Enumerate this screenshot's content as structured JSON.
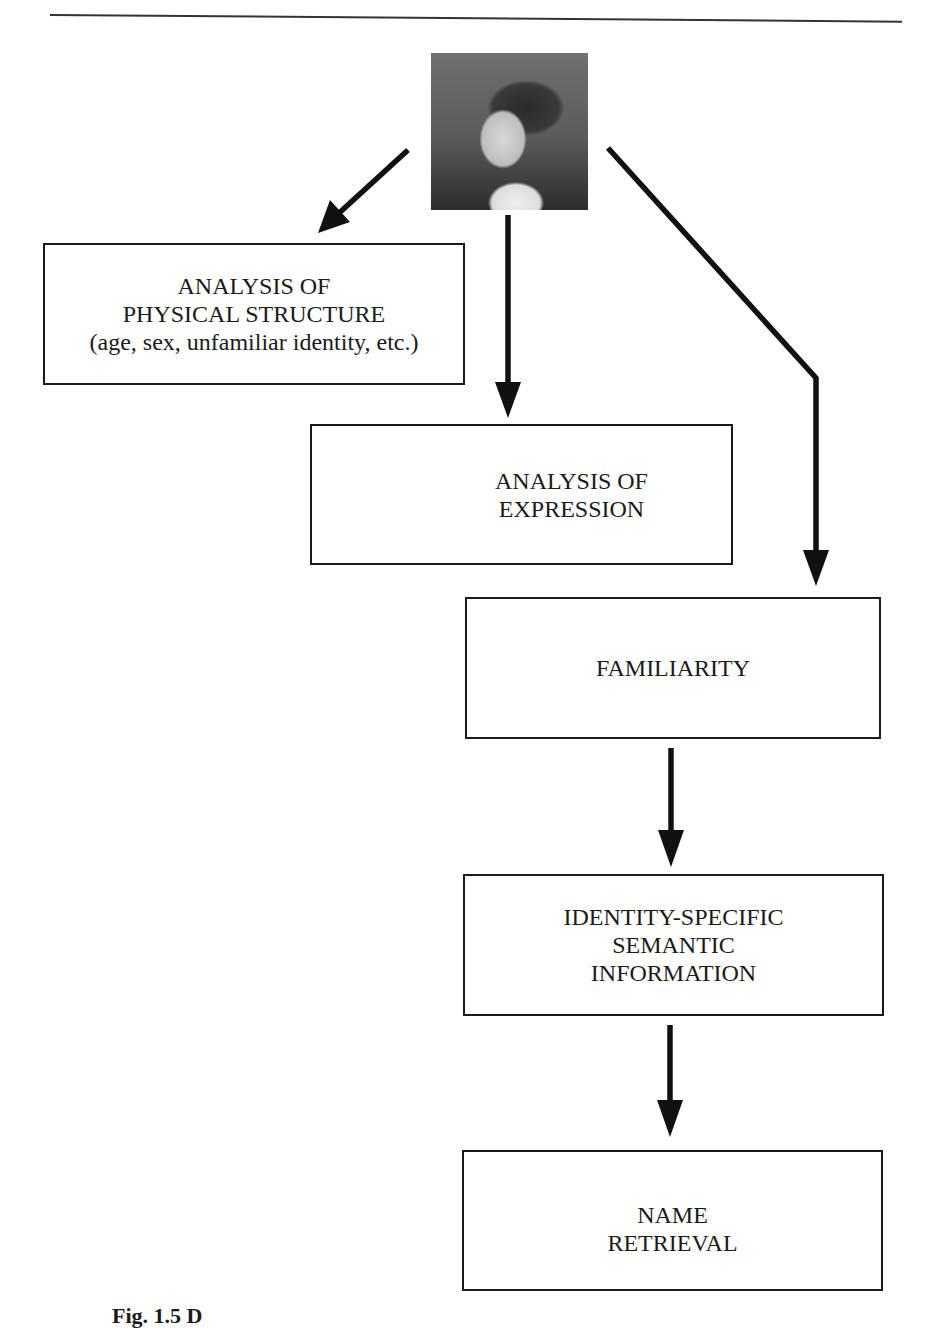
{
  "figure": {
    "photo": {
      "description": "face-photo"
    },
    "boxes": [
      {
        "id": "physical-structure",
        "lines": [
          "ANALYSIS OF",
          "PHYSICAL STRUCTURE",
          "(age, sex, unfamiliar identity, etc.)"
        ]
      },
      {
        "id": "expression",
        "lines": [
          "ANALYSIS OF",
          "EXPRESSION"
        ]
      },
      {
        "id": "familiarity",
        "lines": [
          "FAMILIARITY"
        ]
      },
      {
        "id": "semantic",
        "lines": [
          "IDENTITY-SPECIFIC",
          "SEMANTIC",
          "INFORMATION"
        ]
      },
      {
        "id": "name",
        "lines": [
          "NAME",
          "RETRIEVAL"
        ]
      }
    ],
    "caption": "Fig. 1.5 D"
  }
}
